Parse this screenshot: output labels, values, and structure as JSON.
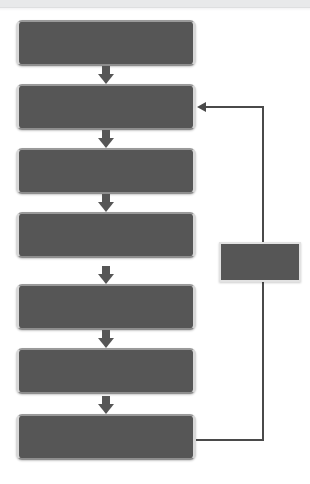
{
  "diagram": {
    "background_color": "#ffffff",
    "box_fill_color": "#565656",
    "box_border_color": "#d8d8d8",
    "connector_color": "#4a4a4a",
    "top_band_color": "#e8e9ea"
  },
  "nodes": [
    {
      "id": "step-1",
      "label": "",
      "shape": "rounded-rectangle",
      "x": 16,
      "y": 20,
      "width": 180,
      "height": 46
    },
    {
      "id": "step-2",
      "label": "",
      "shape": "rounded-rectangle",
      "x": 16,
      "y": 84,
      "width": 180,
      "height": 46
    },
    {
      "id": "step-3",
      "label": "",
      "shape": "rounded-rectangle",
      "x": 16,
      "y": 148,
      "width": 180,
      "height": 46
    },
    {
      "id": "step-4",
      "label": "",
      "shape": "rounded-rectangle",
      "x": 16,
      "y": 212,
      "width": 180,
      "height": 46
    },
    {
      "id": "step-5",
      "label": "",
      "shape": "rounded-rectangle",
      "x": 16,
      "y": 284,
      "width": 180,
      "height": 46
    },
    {
      "id": "step-6",
      "label": "",
      "shape": "rounded-rectangle",
      "x": 16,
      "y": 348,
      "width": 180,
      "height": 46
    },
    {
      "id": "step-7",
      "label": "",
      "shape": "rounded-rectangle",
      "x": 16,
      "y": 414,
      "width": 180,
      "height": 46
    },
    {
      "id": "side-node",
      "label": "",
      "shape": "rectangle",
      "x": 219,
      "y": 242,
      "width": 82,
      "height": 40
    }
  ],
  "arrows": [
    {
      "id": "arrow-1-2",
      "from": "step-1",
      "to": "step-2",
      "style": "block-down",
      "x": 98,
      "y": 66
    },
    {
      "id": "arrow-2-3",
      "from": "step-2",
      "to": "step-3",
      "style": "block-down",
      "x": 98,
      "y": 130
    },
    {
      "id": "arrow-3-4",
      "from": "step-3",
      "to": "step-4",
      "style": "block-down",
      "x": 98,
      "y": 194
    },
    {
      "id": "arrow-4-5",
      "from": "step-4",
      "to": "step-5",
      "style": "block-down",
      "x": 98,
      "y": 266
    },
    {
      "id": "arrow-5-6",
      "from": "step-5",
      "to": "step-6",
      "style": "block-down",
      "x": 98,
      "y": 330
    },
    {
      "id": "arrow-6-7",
      "from": "step-6",
      "to": "step-7",
      "style": "block-down",
      "x": 98,
      "y": 396
    }
  ],
  "feedback_loop": {
    "id": "feedback-step7-to-step2",
    "from": "step-7",
    "to": "step-2",
    "direction": "upward-left",
    "arrowhead": "left",
    "segments": [
      {
        "type": "horizontal",
        "x": 196,
        "y": 440,
        "length": 68
      },
      {
        "type": "vertical",
        "x": 262,
        "y": 107,
        "length": 335
      },
      {
        "type": "horizontal",
        "x": 205,
        "y": 107,
        "length": 59
      }
    ]
  }
}
